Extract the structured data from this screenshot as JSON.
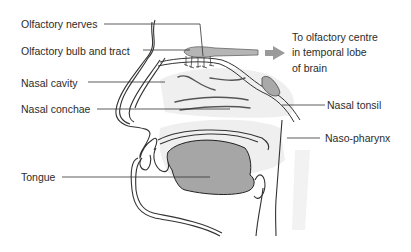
{
  "diagram": {
    "type": "anatomical-cross-section",
    "colors": {
      "background": "#ffffff",
      "line": "#333333",
      "label_text": "#2b2b2b",
      "tissue_fill": "#a9a9a9",
      "tongue_fill": "#a6a6a6",
      "shadow_fill": "#ececec",
      "arrow_fill": "#9a9a9a"
    },
    "labels": {
      "olfactory_nerves": "Olfactory nerves",
      "olfactory_bulb": "Olfactory bulb and tract",
      "nasal_cavity": "Nasal cavity",
      "nasal_conchae": "Nasal conchae",
      "tongue": "Tongue",
      "nasal_tonsil": "Nasal tonsil",
      "naso_pharynx": "Naso-pharynx",
      "olfactory_centre_line1": "To olfactory centre",
      "olfactory_centre_line2": "in temporal lobe",
      "olfactory_centre_line3": "of brain"
    },
    "arrow": {
      "direction": "right",
      "meaning": "signal to olfactory centre"
    }
  }
}
